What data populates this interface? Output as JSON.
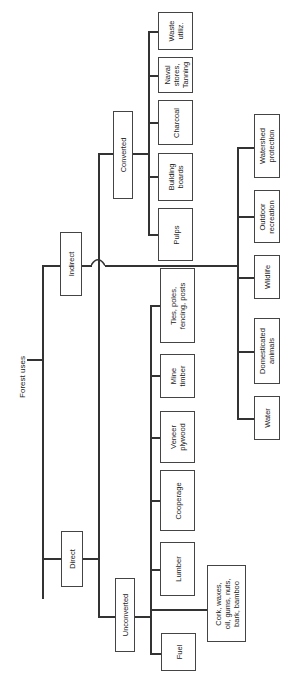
{
  "diagram": {
    "title": "Forest uses",
    "branches": {
      "direct": {
        "label": "Direct",
        "unconverted": {
          "label": "Unconverted",
          "items": [
            "Fuel",
            "Cork, waxes,\noil, gums, nuts,\nbark, bamboo",
            "Lumber",
            "Cooperage",
            "Veneer\nplywood",
            "Mine\ntimber",
            "Ties, poles,\nfencing, posts"
          ]
        },
        "converted": {
          "label": "Converted",
          "items": [
            "Pulps",
            "Building\nboards",
            "Charcoal",
            "Naval\nstores,\nTanning",
            "Waste\nutiliz."
          ]
        }
      },
      "indirect": {
        "label": "Indirect",
        "items": [
          "Water",
          "Domesticated\nanimals",
          "Wildlife",
          "Outdoor\nrecreation",
          "Watershed\nprotection"
        ]
      }
    }
  }
}
